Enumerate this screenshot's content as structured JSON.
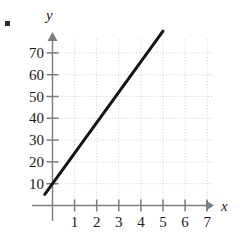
{
  "figure": {
    "bullet": "item-bullet",
    "axis_labels": {
      "x": "x",
      "y": "y"
    }
  },
  "chart_data": {
    "type": "line",
    "title": "",
    "xlabel": "x",
    "ylabel": "y",
    "grid": true,
    "grid_style": "dotted",
    "legend": "none",
    "xlim": [
      -0.6,
      7.6
    ],
    "ylim": [
      -12,
      78
    ],
    "xticks": [
      1,
      2,
      3,
      4,
      5,
      6,
      7
    ],
    "xtick_labels": [
      "1",
      "2",
      "3",
      "4",
      "5",
      "6",
      "7"
    ],
    "yticks": [
      10,
      20,
      30,
      40,
      50,
      60,
      70
    ],
    "ytick_labels": [
      "10",
      "20",
      "30",
      "40",
      "50",
      "60",
      "70"
    ],
    "series": [
      {
        "name": "line",
        "equation": "y = 14x + 10",
        "slope": 14,
        "intercept": 10,
        "x": [
          -0.35,
          5.0
        ],
        "values": [
          5.1,
          80.0
        ],
        "color": "#141414",
        "width": 3
      }
    ],
    "annotations": [],
    "colors": {
      "line": "#141414",
      "axis": "#7d7d7d",
      "grid": "#cfcfcf",
      "text": "#1a1a1a"
    }
  }
}
